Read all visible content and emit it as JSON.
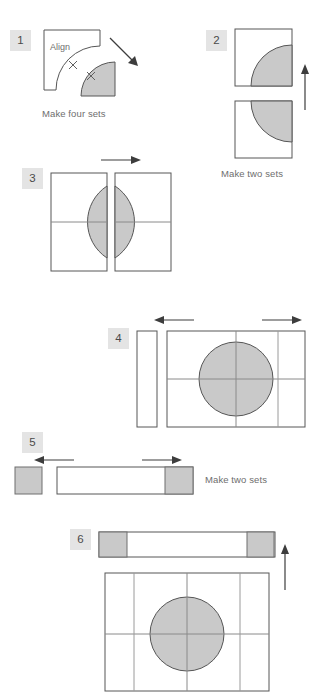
{
  "diagram": {
    "background_color": "#ffffff",
    "shaded_color": "#c9c9c9",
    "outline_color": "#565656",
    "badge_color": "#e4e4e4",
    "text_color": "#6e6e6e"
  },
  "steps": [
    {
      "number": "1",
      "caption": "Make four sets",
      "inline_label": "Align",
      "arrow": "diagonal-down-right"
    },
    {
      "number": "2",
      "caption": "Make two sets",
      "inline_label": "",
      "arrow": "up"
    },
    {
      "number": "3",
      "caption": "",
      "inline_label": "",
      "arrow": "right"
    },
    {
      "number": "4",
      "caption": "",
      "inline_label": "",
      "arrow": "left-and-right"
    },
    {
      "number": "5",
      "caption": "Make two sets",
      "inline_label": "",
      "arrow": "left-and-right"
    },
    {
      "number": "6",
      "caption": "",
      "inline_label": "",
      "arrow": "up"
    }
  ]
}
